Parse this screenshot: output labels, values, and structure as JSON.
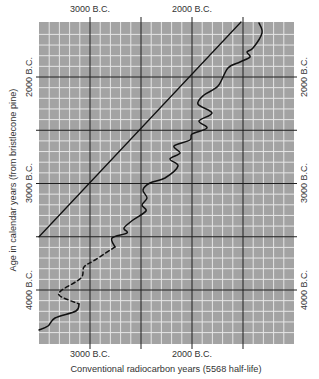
{
  "chart_data": {
    "type": "line",
    "title": "",
    "xlabel": "Conventional radiocarbon years (5568 half-life)",
    "ylabel": "Age in calendar years (from bristlecone pine)",
    "x_axis": {
      "units": "years B.C.",
      "range": [
        3500,
        1000
      ],
      "reversed": true,
      "major_step": 500,
      "minor_step": 100,
      "top_tick_labels": [
        {
          "value": 3000,
          "label": "3000 B.C."
        },
        {
          "value": 2000,
          "label": "2000 B.C."
        }
      ],
      "bottom_tick_labels": [
        {
          "value": 3000,
          "label": "3000 B.C."
        },
        {
          "value": 2000,
          "label": "2000 B.C."
        }
      ]
    },
    "y_axis": {
      "units": "years B.C.",
      "range": [
        1480,
        4500
      ],
      "reversed": true,
      "major_step": 500,
      "minor_step": 100,
      "left_tick_labels": [
        {
          "value": 2000,
          "label": "2000 B.C."
        },
        {
          "value": 3000,
          "label": "3000 B.C."
        },
        {
          "value": 4000,
          "label": "4000 B.C."
        }
      ],
      "right_tick_labels": [
        {
          "value": 2000,
          "label": "2000 B.C."
        },
        {
          "value": 3000,
          "label": "3000 B.C."
        },
        {
          "value": 4000,
          "label": "4000 B.C."
        }
      ]
    },
    "grid": true,
    "legend": null,
    "series": [
      {
        "name": "1:1 reference line (radiocarbon = calendar)",
        "style": "solid",
        "points": [
          [
            3500,
            3500
          ],
          [
            1520,
            1484
          ]
        ]
      },
      {
        "name": "Bristlecone pine calibration curve",
        "style": "solid",
        "points": [
          [
            1343,
            1493
          ],
          [
            1314,
            1587
          ],
          [
            1402,
            1728
          ],
          [
            1461,
            1765
          ],
          [
            1431,
            1812
          ],
          [
            1529,
            1859
          ],
          [
            1647,
            1915
          ],
          [
            1745,
            2085
          ],
          [
            1882,
            2169
          ],
          [
            1941,
            2254
          ],
          [
            1804,
            2338
          ],
          [
            1931,
            2413
          ],
          [
            1853,
            2479
          ],
          [
            2000,
            2535
          ],
          [
            2020,
            2592
          ],
          [
            2176,
            2648
          ],
          [
            2118,
            2714
          ],
          [
            2216,
            2770
          ],
          [
            2137,
            2836
          ],
          [
            2265,
            2948
          ],
          [
            2412,
            2995
          ],
          [
            2480,
            3061
          ],
          [
            2441,
            3136
          ],
          [
            2490,
            3202
          ],
          [
            2451,
            3258
          ],
          [
            2578,
            3343
          ],
          [
            2667,
            3418
          ],
          [
            2637,
            3465
          ],
          [
            2784,
            3512
          ],
          [
            2755,
            3596
          ]
        ]
      },
      {
        "name": "Bristlecone pine calibration curve (uncertain segment)",
        "style": "dashed",
        "points": [
          [
            2755,
            3596
          ],
          [
            2951,
            3718
          ],
          [
            3059,
            3784
          ],
          [
            3088,
            3887
          ],
          [
            3275,
            4000
          ],
          [
            3294,
            4056
          ],
          [
            3108,
            4131
          ]
        ]
      },
      {
        "name": "Bristlecone pine calibration curve (earliest segment)",
        "style": "solid",
        "points": [
          [
            3108,
            4131
          ],
          [
            3137,
            4197
          ],
          [
            3343,
            4263
          ],
          [
            3412,
            4338
          ],
          [
            3500,
            4376
          ]
        ]
      }
    ]
  },
  "labels": {
    "x_title": "Conventional radiocarbon years (5568 half-life)",
    "y_title": "Age in calendar years (from bristlecone pine)",
    "top_3000": "3000 B.C.",
    "top_2000": "2000 B.C.",
    "bottom_3000": "3000 B.C.",
    "bottom_2000": "2000 B.C.",
    "left_2000": "2000 B.C.",
    "left_3000": "3000 B.C.",
    "left_4000": "4000 B.C.",
    "right_2000": "2000 B.C.",
    "right_3000": "3000 B.C.",
    "right_4000": "4000 B.C."
  },
  "colors": {
    "plot_bg": "#a3a3a3",
    "minor_grid": "#e6e6e6",
    "major_grid": "#1e1e1e",
    "curve": "#111111",
    "text": "#333333"
  }
}
